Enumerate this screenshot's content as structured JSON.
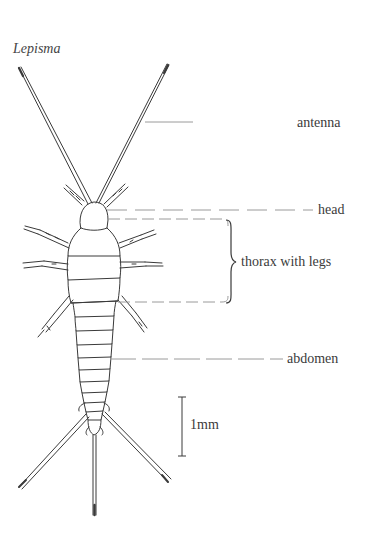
{
  "diagram": {
    "title": "Lepisma",
    "labels": {
      "antenna": "antenna",
      "head": "head",
      "thorax": "thorax with legs",
      "abdomen": "abdomen",
      "scale": "1mm"
    },
    "colors": {
      "line": "#3a3a3a",
      "leader": "#9a9a9a",
      "background": "#ffffff"
    }
  }
}
